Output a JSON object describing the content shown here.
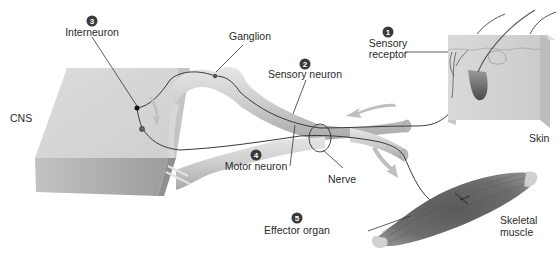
{
  "labels": {
    "cns": "CNS",
    "ganglion": "Ganglion",
    "skin": "Skin",
    "nerve": "Nerve",
    "skeletal_muscle_line1": "Skeletal",
    "skeletal_muscle_line2": "muscle"
  },
  "steps": [
    {
      "number": "1",
      "label_line1": "Sensory",
      "label_line2": "receptor"
    },
    {
      "number": "2",
      "label": "Sensory neuron"
    },
    {
      "number": "3",
      "label": "Interneuron"
    },
    {
      "number": "4",
      "label": "Motor neuron"
    },
    {
      "number": "5",
      "label": "Effector organ"
    }
  ],
  "colors": {
    "cns_block": "#d4d4d4",
    "nerve_tube": "#cfcfcf",
    "skin_block": "#d6d6d6",
    "muscle": "#6a6a6a",
    "neuron_line": "#3a3a3a",
    "arrow": "#bfbfbf"
  }
}
